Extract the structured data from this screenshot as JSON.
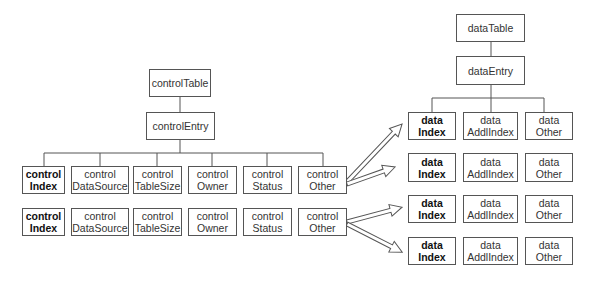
{
  "diagram": {
    "left_tree": {
      "root": {
        "label": "controlTable"
      },
      "entry": {
        "label": "controlEntry"
      },
      "rows": [
        {
          "cells": [
            {
              "line1": "control",
              "line2": "Index",
              "bold": true
            },
            {
              "line1": "control",
              "line2": "DataSource",
              "bold": false
            },
            {
              "line1": "control",
              "line2": "TableSize",
              "bold": false
            },
            {
              "line1": "control",
              "line2": "Owner",
              "bold": false
            },
            {
              "line1": "control",
              "line2": "Status",
              "bold": false
            },
            {
              "line1": "control",
              "line2": "Other",
              "bold": false
            }
          ]
        },
        {
          "cells": [
            {
              "line1": "control",
              "line2": "Index",
              "bold": true
            },
            {
              "line1": "control",
              "line2": "DataSource",
              "bold": false
            },
            {
              "line1": "control",
              "line2": "TableSize",
              "bold": false
            },
            {
              "line1": "control",
              "line2": "Owner",
              "bold": false
            },
            {
              "line1": "control",
              "line2": "Status",
              "bold": false
            },
            {
              "line1": "control",
              "line2": "Other",
              "bold": false
            }
          ]
        }
      ]
    },
    "right_tree": {
      "root": {
        "label": "dataTable"
      },
      "entry": {
        "label": "dataEntry"
      },
      "rows": [
        {
          "cells": [
            {
              "line1": "data",
              "line2": "Index",
              "bold": true
            },
            {
              "line1": "data",
              "line2": "AddlIndex",
              "bold": false
            },
            {
              "line1": "data",
              "line2": "Other",
              "bold": false
            }
          ]
        },
        {
          "cells": [
            {
              "line1": "data",
              "line2": "Index",
              "bold": true
            },
            {
              "line1": "data",
              "line2": "AddlIndex",
              "bold": false
            },
            {
              "line1": "data",
              "line2": "Other",
              "bold": false
            }
          ]
        },
        {
          "cells": [
            {
              "line1": "data",
              "line2": "Index",
              "bold": true
            },
            {
              "line1": "data",
              "line2": "AddlIndex",
              "bold": false
            },
            {
              "line1": "data",
              "line2": "Other",
              "bold": false
            }
          ]
        },
        {
          "cells": [
            {
              "line1": "data",
              "line2": "Index",
              "bold": true
            },
            {
              "line1": "data",
              "line2": "AddlIndex",
              "bold": false
            },
            {
              "line1": "data",
              "line2": "Other",
              "bold": false
            }
          ]
        }
      ]
    },
    "arrows": [
      {
        "from": "controlOther row 1",
        "to": "data row 1"
      },
      {
        "from": "controlOther row 1",
        "to": "data row 2"
      },
      {
        "from": "controlOther row 2",
        "to": "data row 3"
      },
      {
        "from": "controlOther row 2",
        "to": "data row 4"
      }
    ],
    "colors": {
      "line": "#555555",
      "box_border": "#555555",
      "background": "#ffffff"
    }
  }
}
